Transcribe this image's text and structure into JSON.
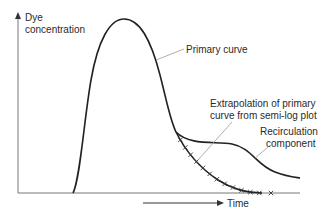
{
  "diagram": {
    "y_axis_label_line1": "Dye",
    "y_axis_label_line2": "concentration",
    "x_axis_label": "Time",
    "labels": {
      "primary_curve": "Primary curve",
      "extrapolation_line1": "Extrapolation of primary",
      "extrapolation_line2": "curve from semi-log plot",
      "recirculation_line1": "Recirculation",
      "recirculation_line2": "component"
    },
    "extrapolation_marker_count": 12,
    "colors": {
      "curve": "#222222",
      "axis": "#777777",
      "leader": "#999999",
      "text": "#2a2a2a"
    }
  }
}
